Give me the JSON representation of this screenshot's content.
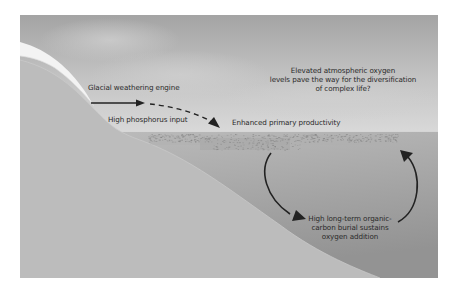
{
  "diagram": {
    "type": "conceptual-cross-section",
    "labels": {
      "glacial": "Glacial weathering engine",
      "phosphorus": "High phosphorus input",
      "productivity": "Enhanced primary productivity",
      "oxygen_line1": "Elevated atmospheric oxygen",
      "oxygen_line2": "levels pave the way for the diversification",
      "oxygen_line3": "of complex life?",
      "burial_line1": "High long-term organic-",
      "burial_line2": "carbon burial sustains",
      "burial_line3": "oxygen addition"
    },
    "colors": {
      "sky_top": "#a6a6a6",
      "sky_bottom": "#d6d6d6",
      "land": "#bcbcbc",
      "water_top": "#b7b7b7",
      "water_bottom": "#979797",
      "glacier": "#f4f4f4",
      "arrow": "#222222",
      "plankton": "#8a8a8a"
    }
  }
}
